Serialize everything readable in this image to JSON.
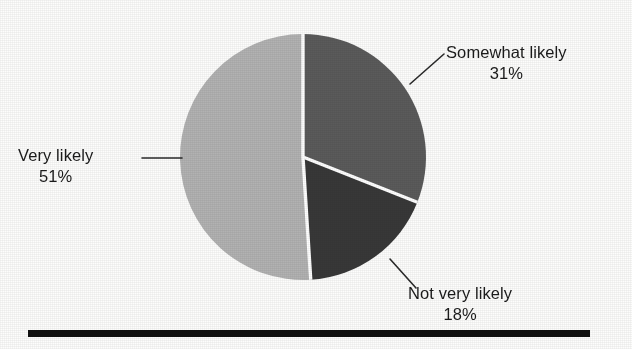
{
  "chart_data": {
    "type": "pie",
    "title": "",
    "subtitle": "",
    "xlabel": "",
    "ylabel": "",
    "legend_position": "callout-labels",
    "grid": false,
    "start_angle_deg": 0,
    "direction": "clockwise",
    "categories": [
      "Somewhat likely",
      "Not very likely",
      "Very likely"
    ],
    "values": [
      31,
      18,
      51
    ],
    "units": "percent",
    "slices": [
      {
        "label": "Somewhat likely",
        "value": 31,
        "value_text": "31%",
        "color": "#5b5b5b",
        "start_deg": 0,
        "end_deg": 111.6,
        "callout": "right-top"
      },
      {
        "label": "Not very likely",
        "value": 18,
        "value_text": "18%",
        "color": "#383838",
        "start_deg": 111.6,
        "end_deg": 176.4,
        "callout": "right-bottom"
      },
      {
        "label": "Very likely",
        "value": 51,
        "value_text": "51%",
        "color": "#b2b2b2",
        "start_deg": 176.4,
        "end_deg": 360,
        "callout": "left"
      }
    ],
    "colors": {
      "somewhat_likely": "#5b5b5b",
      "not_very_likely": "#383838",
      "very_likely": "#b2b2b2",
      "separator": "#ffffff",
      "rule": "#111111",
      "background": "#fdfdfc",
      "text": "#1b1b1b"
    }
  },
  "labels": {
    "somewhat": {
      "name": "Somewhat likely",
      "value": "31%"
    },
    "notvery": {
      "name": "Not very likely",
      "value": "18%"
    },
    "very": {
      "name": "Very likely",
      "value": "51%"
    }
  },
  "footer_rule": {
    "visible": true,
    "color": "#111111"
  }
}
